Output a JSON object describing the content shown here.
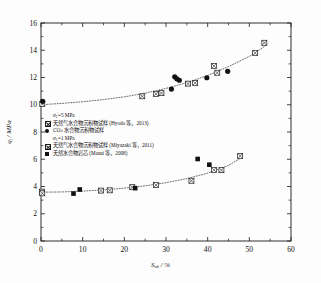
{
  "chart_data": {
    "type": "scatter",
    "title": "",
    "xlabel": "S_mh / %",
    "ylabel": "q_f / MPa",
    "xlim": [
      0,
      60
    ],
    "ylim": [
      0,
      16
    ],
    "xticks": [
      0,
      10,
      20,
      30,
      40,
      50,
      60
    ],
    "yticks": [
      0,
      2,
      4,
      6,
      8,
      10,
      12,
      14,
      16
    ],
    "grid": false,
    "legend_position": "center-left",
    "series": [
      {
        "name": "天然气水合物沉积物试样 (Hyodo 等，2013)",
        "marker": "crossed-square",
        "group": "sigma3-5MPa",
        "points": [
          [
            0.3,
            10.05
          ],
          [
            24.3,
            10.62
          ],
          [
            27.6,
            10.8
          ],
          [
            28.9,
            10.85
          ],
          [
            35.3,
            11.55
          ],
          [
            37.0,
            11.6
          ],
          [
            41.5,
            12.85
          ],
          [
            42.3,
            12.35
          ],
          [
            51.4,
            13.8
          ],
          [
            53.6,
            14.55
          ]
        ]
      },
      {
        "name": "CO₂ 水合物沉积物试样",
        "marker": "filled-circle",
        "group": "sigma3-5MPa",
        "points": [
          [
            0.4,
            10.25
          ],
          [
            31.3,
            11.15
          ],
          [
            32.1,
            12.05
          ],
          [
            32.6,
            11.9
          ],
          [
            33.2,
            11.8
          ],
          [
            39.8,
            11.98
          ],
          [
            44.8,
            12.45
          ]
        ]
      },
      {
        "name": "天然气水合物沉积物试样 (Miyazaki 等，2011)",
        "marker": "crossed-square",
        "group": "sigma3-1MPa",
        "points": [
          [
            0.2,
            3.62
          ],
          [
            0.3,
            3.5
          ],
          [
            14.4,
            3.7
          ],
          [
            16.5,
            3.72
          ],
          [
            21.9,
            3.95
          ],
          [
            27.6,
            4.1
          ],
          [
            36.1,
            4.42
          ],
          [
            41.5,
            5.22
          ],
          [
            43.3,
            5.2
          ],
          [
            47.8,
            6.25
          ]
        ]
      },
      {
        "name": "天然水合物岩芯 (Masui 等，2008)",
        "marker": "filled-square",
        "group": "sigma3-1MPa",
        "points": [
          [
            7.8,
            3.48
          ],
          [
            9.3,
            3.78
          ],
          [
            22.6,
            3.88
          ],
          [
            37.6,
            6.02
          ],
          [
            40.4,
            5.6
          ]
        ]
      }
    ],
    "trendlines": [
      {
        "name": "sigma3-5MPa-trend",
        "style": "dotted",
        "points": [
          [
            0,
            10.0
          ],
          [
            5,
            10.1
          ],
          [
            10,
            10.22
          ],
          [
            15,
            10.38
          ],
          [
            20,
            10.58
          ],
          [
            25,
            10.85
          ],
          [
            30,
            11.2
          ],
          [
            35,
            11.62
          ],
          [
            40,
            12.15
          ],
          [
            45,
            12.8
          ],
          [
            50,
            13.55
          ],
          [
            54,
            14.35
          ]
        ]
      },
      {
        "name": "sigma3-1MPa-trend",
        "style": "dotted",
        "points": [
          [
            0,
            3.58
          ],
          [
            5,
            3.6
          ],
          [
            10,
            3.66
          ],
          [
            15,
            3.75
          ],
          [
            20,
            3.88
          ],
          [
            25,
            4.05
          ],
          [
            30,
            4.28
          ],
          [
            35,
            4.58
          ],
          [
            40,
            4.98
          ],
          [
            45,
            5.55
          ],
          [
            48,
            6.1
          ]
        ]
      }
    ]
  },
  "axes": {
    "x_title": "S",
    "x_title_sub": "mh",
    "x_title_unit": " / %",
    "y_title": "q",
    "y_title_sub": "f",
    "y_title_unit": " / MPa",
    "x_tick_labels": [
      "0",
      "10",
      "20",
      "30",
      "40",
      "50",
      "60"
    ],
    "y_tick_labels": [
      "0",
      "2",
      "4",
      "6",
      "8",
      "10",
      "12",
      "14",
      "16"
    ]
  },
  "legend": {
    "group1_header": {
      "sigma": "σ",
      "sub": "3",
      "prime": "'",
      "rest": "=5 MPa"
    },
    "group2_header": {
      "sigma": "σ",
      "sub": "3",
      "prime": "'",
      "rest": "=1 MPa"
    },
    "entries": [
      {
        "marker": "crossed-square",
        "cn": "天然气水合物沉积物试样",
        "en": " (Hyodo 等，2013)"
      },
      {
        "marker": "filled-circle",
        "cn": "CO₂ 水合物沉积物试样",
        "en": ""
      },
      {
        "marker": "crossed-square",
        "cn": "天然气水合物沉积物试样",
        "en": " (Miyazaki 等，2011)"
      },
      {
        "marker": "filled-square",
        "cn": "天然水合物岩芯",
        "en": " (Masui 等，2008)"
      }
    ]
  },
  "colors": {
    "axis": "#1a1a1a",
    "marker": "#121212",
    "trendline": "#555555",
    "background": "#fdfdfd"
  }
}
